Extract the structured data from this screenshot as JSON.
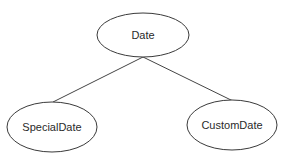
{
  "diagram": {
    "type": "class-hierarchy",
    "nodes": [
      {
        "id": "date",
        "label": "Date",
        "cx": 143,
        "cy": 35,
        "rx": 46,
        "ry": 22
      },
      {
        "id": "special",
        "label": "SpecialDate",
        "cx": 52,
        "cy": 127,
        "rx": 45,
        "ry": 25
      },
      {
        "id": "custom",
        "label": "CustomDate",
        "cx": 232,
        "cy": 125,
        "rx": 45,
        "ry": 25
      }
    ],
    "edges": [
      {
        "from": "date",
        "to": "special"
      },
      {
        "from": "date",
        "to": "custom"
      }
    ]
  }
}
